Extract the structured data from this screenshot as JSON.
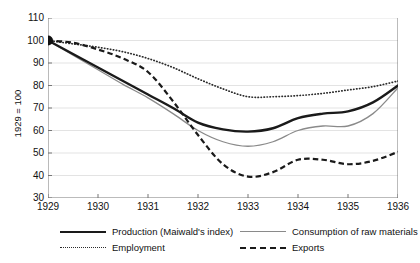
{
  "chart_data": {
    "type": "line",
    "title": "",
    "xlabel": "",
    "ylabel": "1929 = 100",
    "x": [
      1929,
      1930,
      1931,
      1932,
      1933,
      1934,
      1935,
      1936
    ],
    "xlim": [
      1929,
      1936
    ],
    "ylim": [
      30,
      110
    ],
    "yticks": [
      30,
      40,
      50,
      60,
      70,
      80,
      90,
      100,
      110
    ],
    "xticks": [
      "1929",
      "1930",
      "1931",
      "1932",
      "1933",
      "1934",
      "1935",
      "1936"
    ],
    "grid": "horizontal",
    "legend_position": "below",
    "marker": {
      "year": 1929,
      "value": 100,
      "style": "filled-circle"
    },
    "series": [
      {
        "name": "Production (Maiwald's index)",
        "style": "solid-thick",
        "color": "#1a1a1a",
        "values": [
          100,
          88,
          76,
          63,
          59.5,
          66,
          68.5,
          80
        ],
        "detail_x": [
          1929,
          1929.5,
          1930,
          1930.5,
          1931,
          1931.5,
          1932,
          1932.5,
          1933,
          1933.5,
          1934,
          1934.5,
          1935,
          1935.5,
          1936
        ],
        "detail_y": [
          100,
          94,
          88,
          82,
          76,
          70,
          63.5,
          60.5,
          59.5,
          61,
          65.5,
          67.5,
          68.5,
          72.5,
          80
        ]
      },
      {
        "name": "Consumption of raw materials",
        "style": "solid-thin",
        "color": "#8a8a8a",
        "values": [
          100,
          87,
          74.5,
          60,
          53,
          60.5,
          62,
          79
        ],
        "detail_x": [
          1929,
          1929.5,
          1930,
          1930.5,
          1931,
          1931.5,
          1932,
          1932.5,
          1933,
          1933.5,
          1934,
          1934.5,
          1935,
          1935.5,
          1936
        ],
        "detail_y": [
          100,
          93.5,
          87,
          80.5,
          74.5,
          67.5,
          60,
          55,
          53,
          55,
          60,
          62,
          62,
          67.5,
          79
        ]
      },
      {
        "name": "Employment",
        "style": "dotted",
        "color": "#2b2b2b",
        "values": [
          100,
          97,
          92,
          83,
          75,
          76,
          78,
          82
        ],
        "detail_x": [
          1929,
          1929.5,
          1930,
          1930.5,
          1931,
          1931.5,
          1932,
          1932.5,
          1933,
          1933.5,
          1934,
          1934.5,
          1935,
          1935.5,
          1936
        ],
        "detail_y": [
          100,
          98.5,
          97,
          95,
          92,
          88,
          83,
          78.5,
          75,
          75,
          75.5,
          76.5,
          78,
          79.5,
          82
        ]
      },
      {
        "name": "Exports",
        "style": "dashed",
        "color": "#1a1a1a",
        "values": [
          100,
          96,
          86,
          58,
          39.5,
          47,
          45,
          50.5
        ],
        "detail_x": [
          1929,
          1929.5,
          1930,
          1930.5,
          1931,
          1931.5,
          1932,
          1932.5,
          1933,
          1933.5,
          1934,
          1934.5,
          1935,
          1935.5,
          1936
        ],
        "detail_y": [
          100,
          99,
          96,
          92,
          86,
          73,
          58,
          45,
          39.5,
          41.5,
          47,
          47,
          45,
          46.5,
          50.5
        ]
      }
    ]
  },
  "legend": {
    "items": [
      {
        "label": "Production (Maiwald's index)"
      },
      {
        "label": "Consumption of raw materials"
      },
      {
        "label": "Employment"
      },
      {
        "label": "Exports"
      }
    ]
  }
}
